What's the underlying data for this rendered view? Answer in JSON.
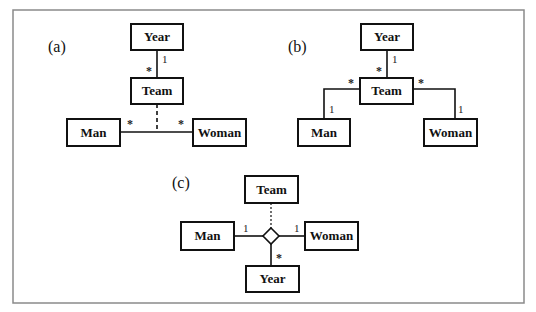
{
  "figure": {
    "panels": [
      {
        "id": "a",
        "label": "(a)",
        "classes": {
          "year": "Year",
          "team": "Team",
          "man": "Man",
          "woman": "Woman"
        },
        "multiplicities": {
          "year_end": "1",
          "team_end": "*",
          "man_end": "*",
          "woman_end": "*"
        },
        "description": "Binary association Man–Woman with association class Team (dashed); Team associated with Year"
      },
      {
        "id": "b",
        "label": "(b)",
        "classes": {
          "year": "Year",
          "team": "Team",
          "man": "Man",
          "woman": "Woman"
        },
        "multiplicities": {
          "year_end": "1",
          "team_year_end": "*",
          "team_man_end": "*",
          "man_end": "1",
          "team_woman_end": "*",
          "woman_end": "1"
        },
        "description": "Team as a class with associations to Year, Man and Woman"
      },
      {
        "id": "c",
        "label": "(c)",
        "classes": {
          "team": "Team",
          "man": "Man",
          "woman": "Woman",
          "year": "Year"
        },
        "multiplicities": {
          "man_end": "1",
          "woman_end": "1",
          "year_end": "*"
        },
        "description": "Ternary association (diamond) among Man, Woman, Year with association class Team (dotted)"
      }
    ]
  }
}
